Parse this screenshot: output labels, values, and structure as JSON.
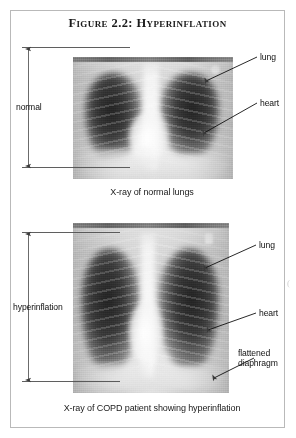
{
  "figure": {
    "title": "Figure 2.2: Hyperinflation",
    "border_color": "#b9b9b9",
    "background": "#ffffff"
  },
  "panels": [
    {
      "id": "normal",
      "caption": "X-ray of normal lungs",
      "measurement": {
        "label": "normal",
        "type": "double-headed-vertical-arrow",
        "meaning": "normal lung height"
      },
      "annotations": [
        {
          "label": "lung",
          "target": "right lung field"
        },
        {
          "label": "heart",
          "target": "cardiac silhouette"
        }
      ]
    },
    {
      "id": "copd",
      "caption": "X-ray of COPD patient showing hyperinflation",
      "measurement": {
        "label": "hyperinflation",
        "type": "double-headed-vertical-arrow",
        "meaning": "increased lung height"
      },
      "annotations": [
        {
          "label": "lung",
          "target": "right lung field"
        },
        {
          "label": "heart",
          "target": "cardiac silhouette"
        },
        {
          "label": "flattened diaphragm",
          "line1": "flattened",
          "line2": "diaphragm",
          "target": "diaphragm dome"
        }
      ]
    }
  ],
  "colors": {
    "text": "#111111",
    "rule": "#4d4d4d",
    "film_light": "#e8e8e8",
    "film_dark": "#262626"
  }
}
